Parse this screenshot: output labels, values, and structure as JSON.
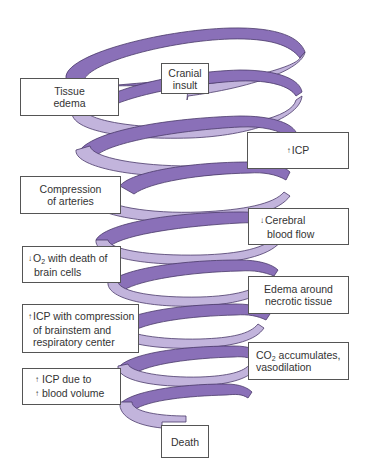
{
  "diagram": {
    "type": "downward spiral",
    "colors": {
      "ribbon_dark": "#8a70b8",
      "ribbon_light": "#c2b4dc",
      "ribbon_outline": "#4a3a6a",
      "box_border": "#555555",
      "text": "#333333"
    },
    "nodes": [
      {
        "id": "cranial-insult",
        "lines": [
          "Cranial",
          "insult"
        ]
      },
      {
        "id": "tissue-edema",
        "lines": [
          "Tissue",
          "edema"
        ]
      },
      {
        "id": "increased-icp",
        "arrow": "↑",
        "lines": [
          "ICP"
        ]
      },
      {
        "id": "compression-of-arteries",
        "lines": [
          "Compression",
          "of arteries"
        ]
      },
      {
        "id": "decreased-cerebral-blood-flow",
        "arrow": "↓",
        "lines": [
          "Cerebral",
          "blood flow"
        ]
      },
      {
        "id": "decreased-o2",
        "arrow": "↓",
        "o2_prefix": "O",
        "o2_sub": "2",
        "lines": [
          " with death of",
          "brain cells"
        ]
      },
      {
        "id": "edema-necrotic",
        "lines": [
          "Edema around",
          "necrotic tissue"
        ]
      },
      {
        "id": "icp-brainstem",
        "arrow": "↑",
        "lines": [
          "ICP with compression",
          "of brainstem and",
          "respiratory center"
        ]
      },
      {
        "id": "co2-accumulates",
        "co2_prefix": "CO",
        "co2_sub": "2",
        "lines": [
          " accumulates,",
          "vasodilation"
        ]
      },
      {
        "id": "icp-blood-volume",
        "arrow": "↑",
        "lines": [
          "ICP due to",
          "blood volume"
        ]
      },
      {
        "id": "death",
        "lines": [
          "Death"
        ]
      }
    ]
  }
}
